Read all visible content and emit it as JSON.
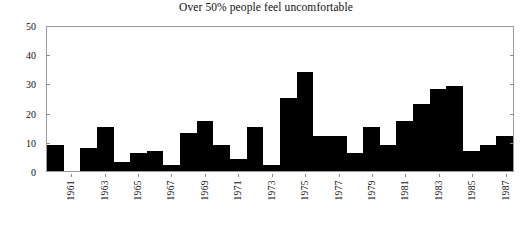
{
  "chart_data": {
    "type": "bar",
    "title": "Over 50% people feel uncomfortable",
    "xlabel": "",
    "ylabel": "",
    "ylim": [
      0,
      50
    ],
    "yticks": [
      0,
      10,
      20,
      30,
      40,
      50
    ],
    "ytick_labels": [
      "0",
      "10",
      "20",
      "30",
      "40",
      "50"
    ],
    "grid": false,
    "legend": "none",
    "bar_color": "#000000",
    "bar_gap": 0,
    "categories": [
      "1960",
      "1961",
      "1962",
      "1963",
      "1964",
      "1965",
      "1966",
      "1967",
      "1968",
      "1969",
      "1970",
      "1971",
      "1972",
      "1973",
      "1974",
      "1975",
      "1976",
      "1977",
      "1978",
      "1979",
      "1980",
      "1981",
      "1982",
      "1983",
      "1984",
      "1985",
      "1986",
      "1987"
    ],
    "values": [
      9,
      0,
      8,
      15,
      3,
      6,
      7,
      2,
      13,
      17,
      9,
      4,
      15,
      2,
      25,
      34,
      12,
      12,
      6,
      15,
      9,
      17,
      23,
      28,
      29,
      7,
      9,
      12
    ],
    "xtick_labels": [
      "1961",
      "1963",
      "1965",
      "1967",
      "1969",
      "1971",
      "1973",
      "1975",
      "1977",
      "1979",
      "1981",
      "1983",
      "1985",
      "1987"
    ],
    "xtick_categories": [
      "1961",
      "1963",
      "1965",
      "1967",
      "1969",
      "1971",
      "1973",
      "1975",
      "1977",
      "1979",
      "1981",
      "1983",
      "1985",
      "1987"
    ]
  },
  "colors": {
    "bar": "#000000",
    "frame": "#9a9a9a",
    "text": "#111111",
    "background": "#ffffff"
  }
}
